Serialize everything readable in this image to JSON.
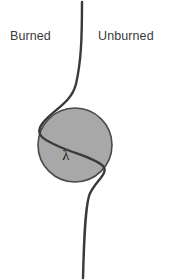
{
  "figure": {
    "background_color": "#ffffff",
    "width": 174,
    "height": 280
  },
  "labels": {
    "left_region": "Burned",
    "right_region": "Unburned",
    "scale_symbol": "λ"
  },
  "colors": {
    "circle_fill": "#a8a8a8",
    "circle_stroke": "#4a4a4a",
    "flame_front_stroke": "#3a3a3a",
    "text": "#3a3a3a",
    "symbol_text": "#1a1a1a"
  },
  "geometry": {
    "circle": {
      "cx": 75,
      "cy": 145,
      "r": 37
    },
    "flame_front_path": "M 82 2 C 82 40, 81 62, 76 84 C 71 104, 52 110, 42 124 C 34 135, 44 140, 60 147 C 76 154, 95 158, 103 166 C 110 173, 93 183, 89 196 C 85 210, 84 240, 83 278",
    "left_label_pos": {
      "x": 10,
      "y": 40
    },
    "right_label_pos": {
      "x": 98,
      "y": 40
    },
    "symbol_pos": {
      "x": 66,
      "y": 160
    }
  },
  "annotations": {
    "description": "A vertical wrinkled flame front curve separates the burned region on the left from the unburned region on the right; a shaded circular eddy of diameter lambda straddles the front."
  }
}
